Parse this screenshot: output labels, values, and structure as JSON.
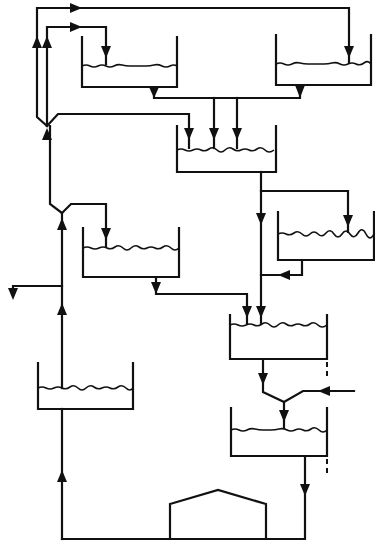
{
  "diagram": {
    "type": "process-flow",
    "colors": {
      "line": "#111111",
      "background": "#ffffff"
    },
    "nodes": [
      {
        "id": "tank-top-left",
        "kind": "tank"
      },
      {
        "id": "tank-top-right",
        "kind": "tank"
      },
      {
        "id": "tank-center",
        "kind": "tank"
      },
      {
        "id": "tank-right-mid",
        "kind": "tank"
      },
      {
        "id": "tank-left-mid",
        "kind": "tank"
      },
      {
        "id": "tank-lower-right",
        "kind": "tank"
      },
      {
        "id": "tank-bottom-right",
        "kind": "tank"
      },
      {
        "id": "tank-bottom-left",
        "kind": "tank"
      },
      {
        "id": "building",
        "kind": "house-shape"
      }
    ],
    "edges": [
      {
        "from": "main-riser",
        "to": "tank-top-right",
        "label": ""
      },
      {
        "from": "main-riser",
        "to": "tank-top-left",
        "label": ""
      },
      {
        "from": "main-riser",
        "to": "tank-center",
        "label": ""
      },
      {
        "from": "tank-top-left",
        "to": "tank-center",
        "label": ""
      },
      {
        "from": "tank-top-right",
        "to": "tank-center",
        "label": ""
      },
      {
        "from": "tank-center",
        "to": "tank-right-mid",
        "label": ""
      },
      {
        "from": "tank-center",
        "to": "tank-lower-right",
        "label": ""
      },
      {
        "from": "tank-right-mid",
        "to": "tank-lower-right",
        "label": ""
      },
      {
        "from": "riser-split",
        "to": "tank-left-mid",
        "label": ""
      },
      {
        "from": "tank-left-mid",
        "to": "tank-lower-right",
        "label": ""
      },
      {
        "from": "tank-lower-right",
        "to": "tank-bottom-right",
        "label": ""
      },
      {
        "from": "side-inlet",
        "to": "tank-bottom-right",
        "label": ""
      },
      {
        "from": "tank-bottom-right",
        "to": "building-return-line",
        "label": ""
      },
      {
        "from": "building-return-line",
        "to": "tank-bottom-left",
        "label": ""
      },
      {
        "from": "tank-bottom-left",
        "to": "main-riser",
        "label": ""
      },
      {
        "from": "main-riser",
        "to": "left-outlet",
        "label": ""
      }
    ]
  }
}
